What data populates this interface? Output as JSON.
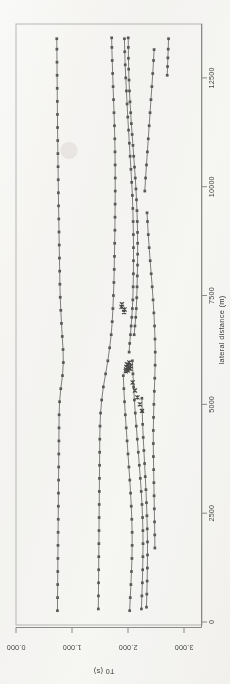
{
  "figure": {
    "kind": "scanned-scientific-plot",
    "orientation_note": "chart rendered rotated 90 degrees on the page",
    "ink_color": "#5a5a5a",
    "frame_color": "#b9b9b9",
    "background_color": "#fbfbfa"
  },
  "chart_data": {
    "type": "line",
    "title": "",
    "xlabel": "lateral distance (m)",
    "ylabel": "T0 (s)",
    "xlim": [
      0,
      13600
    ],
    "ylim": [
      0.0,
      3.0
    ],
    "xticks": [
      0,
      2500,
      5000,
      7500,
      10000,
      12500
    ],
    "xtick_labels": [
      "0",
      "2500",
      "5000",
      "7500",
      "10000",
      "12500"
    ],
    "yticks": [
      0.0,
      1.0,
      2.0,
      3.0
    ],
    "ytick_labels": [
      "0.000",
      "1.000",
      "2.000",
      "3.000"
    ],
    "grid": false,
    "legend": false,
    "marker": "square",
    "secondary_marker": "x",
    "series": [
      {
        "name": "horizon-1",
        "marker": "square",
        "x": [
          260,
          560,
          860,
          1160,
          1460,
          1760,
          2060,
          2360,
          2660,
          2960,
          3260,
          3560,
          3860,
          4160,
          4460,
          4760,
          5060,
          5360,
          5660,
          5960,
          6260,
          6560,
          6860,
          7160,
          7460,
          7760,
          8060,
          8360,
          8660,
          8960,
          9260,
          9560,
          9860,
          10160,
          10460,
          10760,
          11060,
          11360,
          11660,
          11960,
          12260,
          12560,
          12860,
          13160,
          13400
        ],
        "y": [
          0.74,
          0.742,
          0.744,
          0.746,
          0.748,
          0.75,
          0.752,
          0.754,
          0.756,
          0.758,
          0.76,
          0.762,
          0.764,
          0.766,
          0.768,
          0.77,
          0.778,
          0.8,
          0.83,
          0.845,
          0.84,
          0.826,
          0.812,
          0.8,
          0.79,
          0.784,
          0.78,
          0.776,
          0.772,
          0.768,
          0.764,
          0.76,
          0.757,
          0.754,
          0.751,
          0.748,
          0.745,
          0.742,
          0.74,
          0.738,
          0.736,
          0.734,
          0.732,
          0.73,
          0.728
        ]
      },
      {
        "name": "horizon-2",
        "marker": "square",
        "x": [
          300,
          600,
          900,
          1200,
          1500,
          1800,
          2100,
          2400,
          2700,
          3000,
          3300,
          3600,
          3900,
          4200,
          4500,
          4800,
          5100,
          5400,
          5700,
          6000,
          6300,
          6600,
          6900,
          7200,
          7500,
          7800,
          8100,
          8400,
          8700,
          9000,
          9300,
          9600,
          9900,
          10200,
          10500,
          10800,
          11100,
          11400,
          11700,
          12000,
          12300,
          12600,
          12900,
          13200,
          13420
        ],
        "y": [
          1.47,
          1.472,
          1.474,
          1.476,
          1.478,
          1.48,
          1.482,
          1.484,
          1.486,
          1.488,
          1.49,
          1.492,
          1.494,
          1.496,
          1.5,
          1.51,
          1.53,
          1.56,
          1.6,
          1.64,
          1.672,
          1.7,
          1.718,
          1.73,
          1.74,
          1.748,
          1.754,
          1.758,
          1.762,
          1.766,
          1.768,
          1.77,
          1.772,
          1.772,
          1.77,
          1.768,
          1.764,
          1.758,
          1.75,
          1.742,
          1.734,
          1.726,
          1.718,
          1.712,
          1.708
        ]
      },
      {
        "name": "horizon-3",
        "marker": "square",
        "x": [
          6200,
          6400,
          6600,
          6800,
          7000,
          7200,
          7400,
          7700,
          8000,
          8300,
          8600,
          8900,
          9200,
          9500,
          9800,
          10100,
          10400,
          10700,
          11000,
          11300,
          11600,
          11900,
          12200,
          12500,
          12800,
          13100,
          13400
        ],
        "y": [
          2.02,
          2.03,
          2.044,
          2.056,
          2.068,
          2.078,
          2.086,
          2.092,
          2.096,
          2.098,
          2.098,
          2.096,
          2.092,
          2.086,
          2.078,
          2.066,
          2.052,
          2.038,
          2.024,
          2.01,
          1.996,
          1.984,
          1.972,
          1.96,
          1.95,
          1.942,
          1.936
        ]
      },
      {
        "name": "horizon-4",
        "marker": "square",
        "x": [
          6600,
          6800,
          7000,
          7200,
          7450,
          7700,
          7950,
          8200,
          8450,
          8700,
          8950,
          9200,
          9450,
          9700,
          9950,
          10200,
          10450,
          10700,
          10950,
          11200,
          11450,
          11700,
          11950,
          12200,
          12450,
          12700,
          12950,
          13200,
          13420
        ],
        "y": [
          2.11,
          2.124,
          2.138,
          2.148,
          2.156,
          2.162,
          2.166,
          2.17,
          2.172,
          2.172,
          2.17,
          2.166,
          2.16,
          2.152,
          2.142,
          2.13,
          2.116,
          2.102,
          2.088,
          2.074,
          2.06,
          2.048,
          2.036,
          2.026,
          2.018,
          2.012,
          2.008,
          2.006,
          2.004
        ]
      },
      {
        "name": "horizon-5",
        "marker": "square",
        "x": [
          260,
          560,
          860,
          1160,
          1460,
          1760,
          2060,
          2360,
          2660,
          2960,
          3260,
          3560,
          3860,
          4160,
          4460,
          4760,
          5060,
          5360,
          5660
        ],
        "y": [
          2.03,
          2.04,
          2.052,
          2.062,
          2.07,
          2.074,
          2.074,
          2.068,
          2.058,
          2.046,
          2.032,
          2.016,
          2.0,
          1.984,
          1.968,
          1.952,
          1.938,
          1.926,
          1.916
        ]
      },
      {
        "name": "horizon-6",
        "marker": "square",
        "x": [
          300,
          600,
          900,
          1200,
          1500,
          1800,
          2100,
          2400,
          2700,
          3000,
          3300,
          3600,
          3900,
          4200,
          4500,
          4800,
          5100,
          5400,
          5700,
          6000
        ],
        "y": [
          2.24,
          2.248,
          2.256,
          2.262,
          2.266,
          2.268,
          2.266,
          2.26,
          2.25,
          2.236,
          2.22,
          2.202,
          2.184,
          2.166,
          2.148,
          2.13,
          2.114,
          2.1,
          2.088,
          2.078
        ]
      },
      {
        "name": "horizon-7",
        "marker": "square",
        "x": [
          340,
          640,
          940,
          1240,
          1540,
          1840,
          2140,
          2440,
          2740,
          3040,
          3340,
          3640,
          3940,
          4240,
          4540,
          4840,
          5140
        ],
        "y": [
          2.33,
          2.336,
          2.342,
          2.346,
          2.348,
          2.348,
          2.344,
          2.338,
          2.33,
          2.32,
          2.308,
          2.296,
          2.284,
          2.272,
          2.262,
          2.254,
          2.248
        ]
      },
      {
        "name": "horizon-8",
        "marker": "square",
        "x": [
          1700,
          2000,
          2300,
          2600,
          2900,
          3200,
          3500,
          3800,
          4100,
          4400,
          4700,
          5000,
          5300,
          5600,
          5900,
          6200,
          6500,
          6800,
          7100,
          7400,
          7700,
          8000,
          8300,
          8600,
          8900,
          9200,
          9400
        ],
        "y": [
          2.48,
          2.478,
          2.474,
          2.47,
          2.466,
          2.462,
          2.458,
          2.454,
          2.452,
          2.452,
          2.456,
          2.462,
          2.47,
          2.478,
          2.484,
          2.486,
          2.482,
          2.474,
          2.462,
          2.448,
          2.432,
          2.414,
          2.396,
          2.378,
          2.362,
          2.348,
          2.34
        ]
      },
      {
        "name": "horizon-9",
        "marker": "square",
        "x": [
          9900,
          10200,
          10500,
          10800,
          11100,
          11400,
          11700,
          12000,
          12300,
          12600,
          12900,
          13150
        ],
        "y": [
          2.3,
          2.314,
          2.33,
          2.346,
          2.362,
          2.378,
          2.394,
          2.41,
          2.426,
          2.442,
          2.456,
          2.466
        ]
      },
      {
        "name": "horizon-10",
        "marker": "square",
        "x": [
          12560,
          12760,
          12960,
          13160,
          13400
        ],
        "y": [
          2.7,
          2.706,
          2.712,
          2.718,
          2.724
        ]
      }
    ],
    "scatter_overlays": [
      {
        "name": "picks-cluster-a",
        "marker": "x",
        "x": [
          5760,
          5800,
          5860,
          5920,
          5780,
          5840,
          5900,
          5960,
          5820,
          5880
        ],
        "y": [
          1.96,
          1.966,
          1.972,
          1.98,
          2.0,
          2.008,
          2.016,
          2.024,
          2.04,
          2.048
        ]
      },
      {
        "name": "picks-cluster-b",
        "marker": "x",
        "x": [
          5500,
          5320,
          5160,
          5000,
          4850
        ],
        "y": [
          2.084,
          2.124,
          2.168,
          2.212,
          2.25
        ]
      },
      {
        "name": "picks-cluster-c",
        "marker": "x",
        "x": [
          7240,
          7300,
          7120,
          7180
        ],
        "y": [
          1.886,
          1.892,
          1.93,
          1.936
        ]
      }
    ]
  }
}
